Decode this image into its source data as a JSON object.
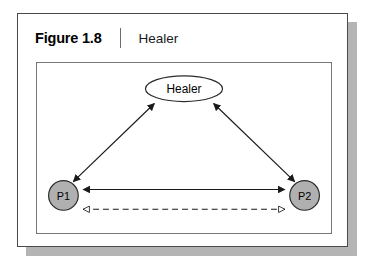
{
  "figure": {
    "number": "Figure 1.8",
    "title": "Healer",
    "separator": "vertical-rule"
  },
  "colors": {
    "frame_border": "#4a4a4a",
    "panel_border": "#777777",
    "shadow": "#b4b4b4",
    "node_fill_person": "#b0b0b0",
    "node_fill_healer": "#ffffff",
    "node_stroke": "#2b2b2b",
    "line": "#1a1a1a",
    "background": "#ffffff"
  },
  "diagram": {
    "type": "triangle-relationship-diagram",
    "nodes": [
      {
        "id": "healer",
        "label": "Healer",
        "shape": "ellipse",
        "fill": "white",
        "x": 148,
        "y": 26,
        "rx": 39,
        "ry": 13
      },
      {
        "id": "p1",
        "label": "P1",
        "shape": "circle",
        "fill": "grey",
        "x": 26,
        "y": 134,
        "r": 15
      },
      {
        "id": "p2",
        "label": "P2",
        "shape": "circle",
        "fill": "grey",
        "x": 270,
        "y": 134,
        "r": 15
      }
    ],
    "edges": [
      {
        "id": "p1-healer",
        "from": "p1",
        "to": "healer",
        "style": "solid",
        "arrowheads": "both",
        "head_fill": "filled"
      },
      {
        "id": "p2-healer",
        "from": "p2",
        "to": "healer",
        "style": "solid",
        "arrowheads": "both",
        "head_fill": "filled"
      },
      {
        "id": "p1-p2-solid",
        "from": "p1",
        "to": "p2",
        "style": "solid",
        "arrowheads": "both",
        "head_fill": "filled"
      },
      {
        "id": "p1-p2-dashed",
        "from": "p1",
        "to": "p2",
        "style": "dashed",
        "arrowheads": "both",
        "head_fill": "hollow"
      }
    ]
  }
}
